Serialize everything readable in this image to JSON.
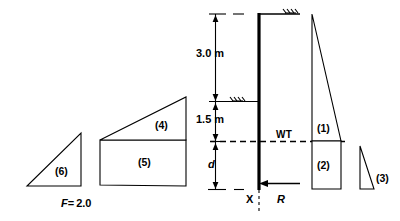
{
  "figure": {
    "safety_factor": {
      "symbol": "F",
      "equals": "=",
      "value": "2.0",
      "full_text": "F = 2.0"
    },
    "dimensions": [
      {
        "id": "upper-soil-depth",
        "label": "3.0 m"
      },
      {
        "id": "lower-soil-depth",
        "label": "1.5 m"
      },
      {
        "id": "embedment-depth",
        "label": "d"
      }
    ],
    "annotations": [
      {
        "id": "water-table",
        "label": "WT"
      },
      {
        "id": "pivot-point",
        "label": "X"
      },
      {
        "id": "reaction-force",
        "label": "R"
      }
    ],
    "pressure_blocks": [
      {
        "id": "block-1",
        "label": "(1)",
        "shape": "triangle"
      },
      {
        "id": "block-2",
        "label": "(2)",
        "shape": "rectangle"
      },
      {
        "id": "block-3",
        "label": "(3)",
        "shape": "triangle"
      }
    ],
    "resistance_blocks": [
      {
        "id": "block-4",
        "label": "(4)",
        "shape": "triangle"
      },
      {
        "id": "block-5",
        "label": "(5)",
        "shape": "rectangle"
      },
      {
        "id": "block-6",
        "label": "(6)",
        "shape": "triangle"
      }
    ],
    "colors": {
      "stroke": "#000000",
      "background": "#ffffff"
    }
  }
}
